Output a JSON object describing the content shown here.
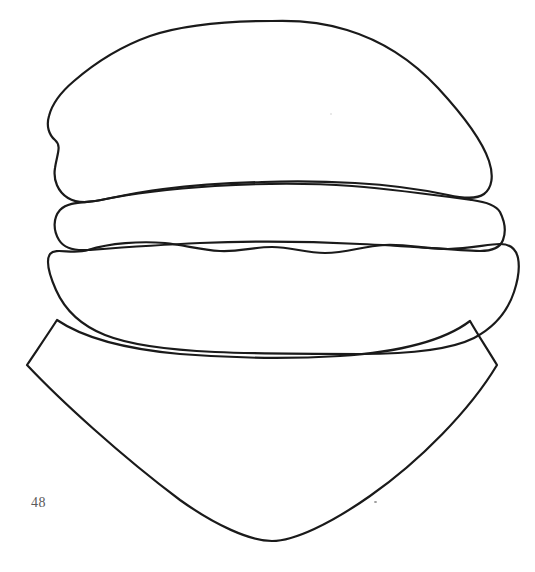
{
  "page": {
    "width": 535,
    "height": 572,
    "background_color": "#ffffff",
    "page_number": "48",
    "page_number_color": "#5a5a5a",
    "line_color": "#1a1a1a",
    "line_width": 2.2,
    "fill_color": "none",
    "kind": "coloring-book-line-art"
  },
  "artwork": {
    "title": "Hamburger line drawing",
    "description": "Black outline line art of a hamburger: a large domed top bun, a filling layer, a wavy patty or lettuce layer, a rounded bottom bun, and a pointed napkin or wrapper shape beneath.",
    "shapes": [
      {
        "name": "top-bun",
        "label": "Top bun",
        "path": "M 272 21 C 300 20 322 22 347 30 C 380 40 412 60 438 88 C 462 114 482 140 489 161 C 494 176 492 188 484 194 C 476 200 462 198 448 195 C 420 189 390 185 355 183 C 320 181 290 181 262 182 C 230 183 196 185 163 189 C 138 192 116 197 101 200 C 88 203 76 203 68 198 C 58 192 53 180 55 168 C 57 154 62 146 55 140 C 49 135 46 126 49 116 C 52 104 61 92 74 81 C 96 62 122 46 150 36 C 186 24 228 21 272 21 Z"
      },
      {
        "name": "filling-layer",
        "label": "Middle filling layer",
        "path": "M 101 200 C 130 194 170 189 215 186 C 265 183 310 183 352 186 C 400 190 443 196 472 200 C 486 202 496 205 500 212 C 505 222 506 232 503 240 C 500 248 492 251 480 251 C 450 250 410 246 360 244 C 300 241 250 241 200 243 C 155 245 115 248 88 250 C 74 251 64 248 59 240 C 53 230 53 218 60 210 C 69 201 85 203 101 200 Z"
      },
      {
        "name": "patty-layer",
        "label": "Wavy patty or lettuce layer",
        "path": "M 88 250 C 110 243 140 241 165 243 C 185 245 200 250 220 251 C 240 252 252 247 272 247 C 292 247 305 253 325 253 C 348 253 362 246 385 245 C 408 244 425 249 448 249 C 470 249 488 244 500 244 C 510 244 516 249 518 258 C 520 268 518 280 514 292 C 508 310 495 327 474 338 C 450 350 410 354 360 354 C 310 354 260 354 215 352 C 170 350 130 345 105 335 C 80 325 64 308 56 290 C 48 272 46 260 50 254 C 56 247 72 255 88 250 Z"
      },
      {
        "name": "napkin-wrapper",
        "label": "Pointed napkin or wrapper shape",
        "path": "M 57 320 C 48 334 37 350 27 365 C 60 400 120 455 180 500 C 215 525 250 541 272 541 C 294 541 330 524 370 496 C 420 461 470 410 497 365 C 488 350 478 335 470 321 C 445 340 400 352 340 356 C 290 359 230 358 180 354 C 125 349 82 337 57 320 Z"
      }
    ]
  }
}
